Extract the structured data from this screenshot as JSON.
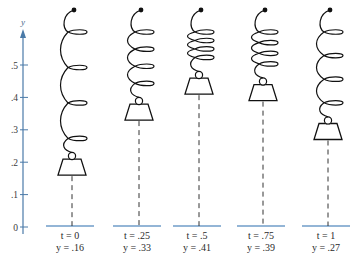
{
  "figure": {
    "colors": {
      "axis": "#4a7aa8",
      "baseline": "#6f9cc8",
      "ink": "#111111",
      "dash": "#333333"
    },
    "axis": {
      "label": "y",
      "ticks": [
        {
          "value": 0,
          "label": "0"
        },
        {
          "value": 0.1,
          "label": ".1"
        },
        {
          "value": 0.2,
          "label": ".2"
        },
        {
          "value": 0.3,
          "label": ".3"
        },
        {
          "value": 0.4,
          "label": ".4"
        },
        {
          "value": 0.5,
          "label": ".5"
        }
      ]
    },
    "springs": [
      {
        "t": "0",
        "y": 0.16,
        "t_label": "t = 0",
        "y_label": "y = .16",
        "cx": 72,
        "coils": 3
      },
      {
        "t": ".25",
        "y": 0.33,
        "t_label": "t = .25",
        "y_label": "y = .33",
        "cx": 139,
        "coils": 3
      },
      {
        "t": ".5",
        "y": 0.41,
        "t_label": "t = .5",
        "y_label": "y = .41",
        "cx": 199,
        "coils": 3
      },
      {
        "t": ".75",
        "y": 0.39,
        "t_label": "t = .75",
        "y_label": "y = .39",
        "cx": 263,
        "coils": 3
      },
      {
        "t": "1",
        "y": 0.27,
        "t_label": "t = 1",
        "y_label": "y = .27",
        "cx": 328,
        "coils": 3
      }
    ]
  },
  "chart_data": {
    "type": "scatter",
    "title": "",
    "xlabel": "t",
    "ylabel": "y",
    "x": [
      0,
      0.25,
      0.5,
      0.75,
      1
    ],
    "series": [
      {
        "name": "y(t)",
        "values": [
          0.16,
          0.33,
          0.41,
          0.39,
          0.27
        ]
      }
    ],
    "ylim": [
      0,
      0.5
    ],
    "yticks": [
      0,
      0.1,
      0.2,
      0.3,
      0.4,
      0.5
    ]
  }
}
